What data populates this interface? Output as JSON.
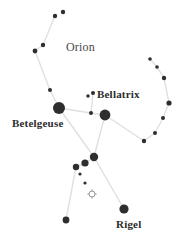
{
  "figure": {
    "title": "Orion",
    "type": "star-chart",
    "width": 184,
    "height": 250,
    "background_color": "#ffffff",
    "star_color": "#2e2e2e",
    "line_color": "#e0e0e0",
    "label_color": "#2b2b2b"
  },
  "labels": [
    {
      "id": "orion",
      "text": "Orion",
      "x": 66,
      "y": 40,
      "size": 12,
      "weight": "light"
    },
    {
      "id": "bellatrix",
      "text": "Bellatrix",
      "x": 97,
      "y": 88,
      "size": 11,
      "weight": "bold"
    },
    {
      "id": "betelgeuse",
      "text": "Betelgeuse",
      "x": 12,
      "y": 117,
      "size": 11,
      "weight": "bold"
    },
    {
      "id": "rigel",
      "text": "Rigel",
      "x": 116,
      "y": 218,
      "size": 11,
      "weight": "bold"
    }
  ],
  "stars": [
    {
      "name": "club-tip-upper",
      "x": 63,
      "y": 12,
      "r": 2.2
    },
    {
      "name": "club-tip-lower",
      "x": 55,
      "y": 16,
      "r": 2.2
    },
    {
      "name": "club-mid-upper",
      "x": 43,
      "y": 45,
      "r": 2.2
    },
    {
      "name": "club-mid-lower",
      "x": 35,
      "y": 51,
      "r": 2.4
    },
    {
      "name": "arm-upper",
      "x": 50,
      "y": 90,
      "r": 2.0
    },
    {
      "name": "betelgeuse-star",
      "x": 59,
      "y": 108,
      "r": 6.0
    },
    {
      "name": "meissa-a",
      "x": 88,
      "y": 96,
      "r": 1.7
    },
    {
      "name": "meissa-b",
      "x": 93,
      "y": 93,
      "r": 2.0
    },
    {
      "name": "meissa-c",
      "x": 91,
      "y": 113,
      "r": 2.0
    },
    {
      "name": "bellatrix-star",
      "x": 105,
      "y": 115,
      "r": 5.4
    },
    {
      "name": "shield-1",
      "x": 150,
      "y": 59,
      "r": 1.8
    },
    {
      "name": "shield-2",
      "x": 157,
      "y": 67,
      "r": 1.8
    },
    {
      "name": "shield-3",
      "x": 164,
      "y": 78,
      "r": 2.2
    },
    {
      "name": "shield-4",
      "x": 169,
      "y": 103,
      "r": 2.6
    },
    {
      "name": "shield-5",
      "x": 163,
      "y": 118,
      "r": 2.0
    },
    {
      "name": "shield-6",
      "x": 155,
      "y": 133,
      "r": 2.0
    },
    {
      "name": "shield-7",
      "x": 144,
      "y": 141,
      "r": 2.2
    },
    {
      "name": "belt-alnitak",
      "x": 94,
      "y": 157,
      "r": 4.2
    },
    {
      "name": "belt-alnilam",
      "x": 85,
      "y": 163,
      "r": 3.6
    },
    {
      "name": "belt-mintaka",
      "x": 76,
      "y": 167,
      "r": 3.2
    },
    {
      "name": "sword-upper",
      "x": 80,
      "y": 174,
      "r": 1.6
    },
    {
      "name": "sword-lower",
      "x": 85,
      "y": 183,
      "r": 1.6
    },
    {
      "name": "saiph",
      "x": 66,
      "y": 220,
      "r": 3.4
    },
    {
      "name": "rigel-star",
      "x": 124,
      "y": 209,
      "r": 4.6
    }
  ],
  "nebula": {
    "name": "orion-nebula",
    "x": 92,
    "y": 194,
    "r": 3.0,
    "symbol": "cluster"
  },
  "lines": [
    {
      "from": "club-tip-lower",
      "to": "club-mid-upper"
    },
    {
      "from": "club-mid-upper",
      "to": "club-mid-lower"
    },
    {
      "from": "club-mid-lower",
      "to": "arm-upper"
    },
    {
      "from": "arm-upper",
      "to": "betelgeuse-star"
    },
    {
      "from": "betelgeuse-star",
      "to": "meissa-c"
    },
    {
      "from": "meissa-c",
      "to": "bellatrix-star"
    },
    {
      "from": "meissa-b",
      "to": "meissa-c"
    },
    {
      "from": "bellatrix-star",
      "to": "shield-7"
    },
    {
      "from": "shield-1",
      "to": "shield-2"
    },
    {
      "from": "shield-2",
      "to": "shield-3"
    },
    {
      "from": "shield-3",
      "to": "shield-4"
    },
    {
      "from": "shield-4",
      "to": "shield-5"
    },
    {
      "from": "shield-5",
      "to": "shield-6"
    },
    {
      "from": "shield-6",
      "to": "shield-7"
    },
    {
      "from": "betelgeuse-star",
      "to": "belt-alnitak"
    },
    {
      "from": "bellatrix-star",
      "to": "belt-alnitak"
    },
    {
      "from": "belt-alnitak",
      "to": "belt-alnilam"
    },
    {
      "from": "belt-alnilam",
      "to": "belt-mintaka"
    },
    {
      "from": "belt-mintaka",
      "to": "saiph"
    },
    {
      "from": "belt-alnitak",
      "to": "rigel-star"
    }
  ]
}
